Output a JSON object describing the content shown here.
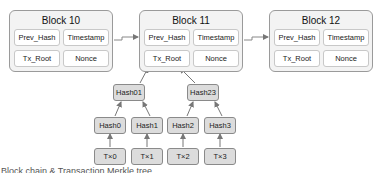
{
  "blocks": [
    {
      "title": "Block 10",
      "fields": [
        "Prev_Hash",
        "Timestamp",
        "Tx_Root",
        "Nonce"
      ]
    },
    {
      "title": "Block 11",
      "fields": [
        "Prev_Hash",
        "Timestamp",
        "Tx_Root",
        "Nonce"
      ]
    },
    {
      "title": "Block 12",
      "fields": [
        "Prev_Hash",
        "Timestamp",
        "Tx_Root",
        "Nonce"
      ]
    }
  ],
  "merkle": {
    "level2": [
      "Hash01",
      "Hash23"
    ],
    "level1": [
      "Hash0",
      "Hash1",
      "Hash2",
      "Hash3"
    ],
    "transactions": [
      "T×0",
      "T×1",
      "T×2",
      "T×3"
    ]
  },
  "caption": "Block chain & Transaction Merkle tree"
}
